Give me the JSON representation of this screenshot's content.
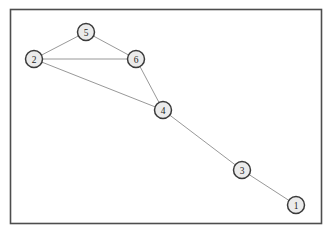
{
  "figure": {
    "type": "node-link-graph",
    "width": 331,
    "height": 238,
    "background_color": "#ffffff"
  },
  "frame": {
    "name": "plot-border",
    "x": 10.5,
    "y": 9.5,
    "width": 311,
    "height": 214,
    "stroke_color": "#4d4d4d",
    "stroke_width": 1.6,
    "fill_color": "#ffffff"
  },
  "style": {
    "node_radius": 8.5,
    "node_fill": "#ebebeb",
    "node_stroke": "#3a3a3a",
    "node_stroke_width": 1.5,
    "node_label_color": "#1c1c1c",
    "edge_color": "#8c8c8c",
    "edge_width": 0.9
  },
  "chart_data": {
    "type": "graph",
    "title": "",
    "xlabel": "",
    "ylabel": "",
    "grid": false,
    "legend": "none",
    "xlim": [
      0,
      331
    ],
    "ylim": [
      0,
      238
    ],
    "nodes": [
      {
        "id": "1",
        "label": "1",
        "x": 296,
        "y": 205
      },
      {
        "id": "2",
        "label": "2",
        "x": 34,
        "y": 59
      },
      {
        "id": "3",
        "label": "3",
        "x": 242,
        "y": 170
      },
      {
        "id": "4",
        "label": "4",
        "x": 163,
        "y": 110
      },
      {
        "id": "5",
        "label": "5",
        "x": 86,
        "y": 32
      },
      {
        "id": "6",
        "label": "6",
        "x": 136,
        "y": 59
      }
    ],
    "edges": [
      {
        "source": "2",
        "target": "5"
      },
      {
        "source": "5",
        "target": "6"
      },
      {
        "source": "2",
        "target": "6"
      },
      {
        "source": "2",
        "target": "4"
      },
      {
        "source": "6",
        "target": "4"
      },
      {
        "source": "4",
        "target": "3"
      },
      {
        "source": "3",
        "target": "1"
      }
    ]
  }
}
